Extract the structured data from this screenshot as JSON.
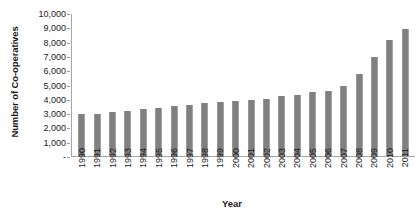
{
  "chart_data": {
    "type": "bar",
    "title": "",
    "xlabel": "Year",
    "ylabel": "Number of Co-operatives",
    "categories": [
      "1990",
      "1991",
      "1992",
      "1993",
      "1994",
      "1995",
      "1996",
      "1997",
      "1998",
      "1999",
      "2000",
      "2001",
      "2002",
      "2003",
      "2004",
      "2005",
      "2006",
      "2007",
      "2008",
      "2009",
      "2010",
      "2011"
    ],
    "values": [
      2950,
      2950,
      3050,
      3150,
      3200,
      3300,
      3350,
      3450,
      3500,
      3600,
      3700,
      3750,
      3800,
      3900,
      3850,
      3950,
      4100,
      4200,
      4350,
      4500,
      4650,
      4800
    ],
    "ylim": [
      0,
      10000
    ],
    "ytick_step": 1000,
    "ytick_labels": [
      "10,000",
      "9,000",
      "8,000",
      "7,000",
      "6,000",
      "5,000",
      "4,000",
      "3,000",
      "2,000",
      "1,000",
      "-"
    ],
    "grid": false,
    "legend": "none",
    "bar_color": "#808080",
    "axis_color": "#a6a6a6"
  },
  "series_display": {
    "bars": [
      {
        "year": "1990",
        "value": 2950
      },
      {
        "year": "1991",
        "value": 2980
      },
      {
        "year": "1992",
        "value": 3080
      },
      {
        "year": "1993",
        "value": 3200
      },
      {
        "year": "1994",
        "value": 3300
      },
      {
        "year": "1995",
        "value": 3380
      },
      {
        "year": "1996",
        "value": 3500
      },
      {
        "year": "1997",
        "value": 3600
      },
      {
        "year": "1998",
        "value": 3750
      },
      {
        "year": "1999",
        "value": 3820
      },
      {
        "year": "2000",
        "value": 3900
      },
      {
        "year": "2001",
        "value": 3950
      },
      {
        "year": "2002",
        "value": 4000
      },
      {
        "year": "2003",
        "value": 4200
      },
      {
        "year": "2004",
        "value": 4300
      },
      {
        "year": "2005",
        "value": 4500
      },
      {
        "year": "2006",
        "value": 4600
      },
      {
        "year": "2007",
        "value": 4900
      },
      {
        "year": "2008",
        "value": 5800
      },
      {
        "year": "2009",
        "value": 7000
      },
      {
        "year": "2010",
        "value": 8150
      },
      {
        "year": "2011",
        "value": 8950
      }
    ]
  }
}
